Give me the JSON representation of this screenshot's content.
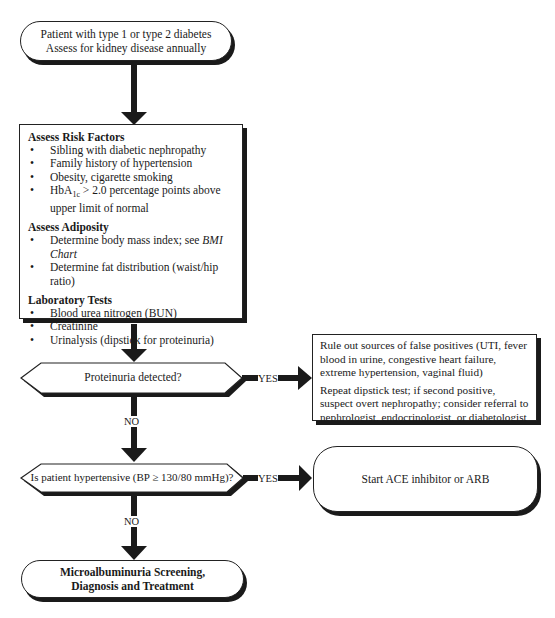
{
  "flowchart": {
    "start": {
      "line1": "Patient with type 1 or type 2 diabetes",
      "line2": "Assess for kidney disease annually"
    },
    "assessment": {
      "sections": [
        {
          "title": "Assess Risk Factors",
          "items": [
            "Sibling with diabetic nephropathy",
            "Family history of hypertension",
            "Obesity, cigarette smoking",
            "HbA1c > 2.0 percentage points above upper limit of normal"
          ]
        },
        {
          "title": "Assess Adiposity",
          "items": [
            "Determine body mass index; see",
            "Determine fat distribution (waist/hip ratio)"
          ],
          "bmi_link": "BMI Chart"
        },
        {
          "title": "Laboratory Tests",
          "items": [
            "Blood urea nitrogen (BUN)",
            "Creatinine",
            "Urinalysis (dipstick for proteinuria)"
          ]
        }
      ],
      "hba1c": {
        "prefix": "HbA",
        "subscript": "1c",
        "suffix": " > 2.0 percentage points above upper limit of normal"
      }
    },
    "decision1": {
      "question": "Proteinuria detected?",
      "yes_label": "YES",
      "no_label": "NO"
    },
    "false_positive_box": {
      "para1": "Rule out sources of false positives (UTI, fever blood in urine, congestive heart failure, extreme hypertension, vaginal fluid)",
      "para2": "Repeat dipstick test; if second positive, suspect overt nephropathy; consider referral to nephrologist, endocrinologist, or diabetologist"
    },
    "decision2": {
      "question": "Is patient hypertensive (BP ≥ 130/80 mmHg)?",
      "yes_label": "YES",
      "no_label": "NO"
    },
    "ace_box": {
      "text": "Start ACE inhibitor or ARB"
    },
    "final": {
      "line1": "Microalbuminuria Screening,",
      "line2": "Diagnosis and Treatment"
    }
  },
  "colors": {
    "line": "#1a1a1a",
    "background": "#ffffff"
  }
}
